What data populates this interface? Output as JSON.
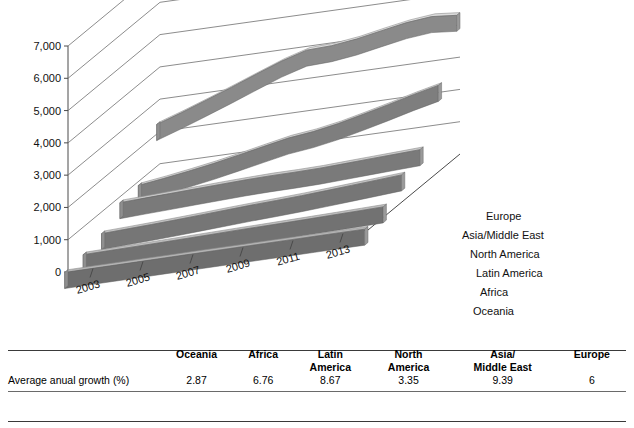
{
  "chart_data": {
    "type": "area",
    "subtype": "3d-stacked-ribbon",
    "title": "",
    "xlabel": "",
    "ylabel": "",
    "ylim": [
      0,
      7000
    ],
    "yticks": [
      "0",
      "1,000",
      "2,000",
      "3,000",
      "4,000",
      "5,000",
      "6,000",
      "7,000"
    ],
    "ytick_values": [
      0,
      1000,
      2000,
      3000,
      4000,
      5000,
      6000,
      7000
    ],
    "grid": true,
    "legend_position": "right-inline",
    "x": [
      2002,
      2003,
      2004,
      2005,
      2006,
      2007,
      2008,
      2009,
      2010,
      2011,
      2012,
      2013,
      2014
    ],
    "xtick_labels": [
      "2003",
      "2005",
      "2007",
      "2009",
      "2011",
      "2013"
    ],
    "xtick_values": [
      2003,
      2005,
      2007,
      2009,
      2011,
      2013
    ],
    "series": [
      {
        "name": "Oceania",
        "values": [
          70,
          74,
          79,
          83,
          88,
          92,
          95,
          97,
          99,
          102,
          105,
          108,
          110
        ]
      },
      {
        "name": "Africa",
        "values": [
          150,
          162,
          175,
          188,
          203,
          219,
          235,
          248,
          262,
          278,
          295,
          312,
          330
        ]
      },
      {
        "name": "Latin America",
        "values": [
          330,
          362,
          398,
          436,
          478,
          522,
          565,
          600,
          640,
          690,
          742,
          795,
          850
        ]
      },
      {
        "name": "North America",
        "values": [
          820,
          852,
          885,
          918,
          950,
          980,
          1000,
          1005,
          1020,
          1055,
          1090,
          1125,
          1160
        ]
      },
      {
        "name": "Asia/Middle East",
        "values": [
          880,
          985,
          1105,
          1235,
          1385,
          1545,
          1700,
          1790,
          1930,
          2110,
          2300,
          2500,
          2680
        ]
      },
      {
        "name": "Europe",
        "values": [
          2300,
          2560,
          2840,
          3130,
          3430,
          3720,
          3950,
          3980,
          4080,
          4230,
          4370,
          4450,
          4380
        ]
      }
    ]
  },
  "table": {
    "row_label_header": "",
    "columns": [
      {
        "line1": "Oceania",
        "line2": ""
      },
      {
        "line1": "Africa",
        "line2": ""
      },
      {
        "line1": "Latin",
        "line2": "America"
      },
      {
        "line1": "North",
        "line2": "America"
      },
      {
        "line1": "Asia/",
        "line2": "Middle East"
      },
      {
        "line1": "Europe",
        "line2": ""
      }
    ],
    "rows": [
      {
        "label": "Average anual growth (%)",
        "values": [
          "2.87",
          "6.76",
          "8.67",
          "3.35",
          "9.39",
          "6"
        ]
      }
    ]
  },
  "colors": {
    "band_top_light": "#d6d6d6",
    "band_top_mid": "#b9b9b9",
    "band_top_dark": "#a8a8a8",
    "band_edge": "#7b7b7b",
    "band_edge_dark": "#636363",
    "axis_line": "#4a4a4a",
    "grid_line": "#6f6f6f",
    "text": "#111111",
    "rule": "#3a3a3a"
  }
}
